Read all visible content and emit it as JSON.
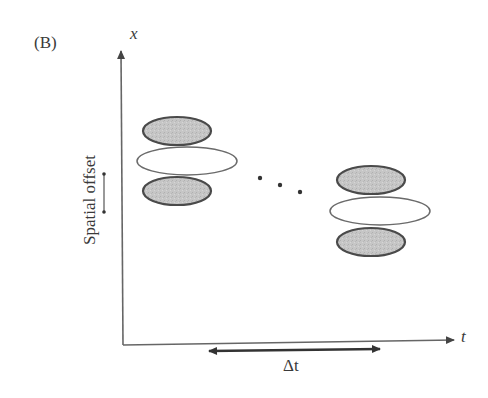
{
  "figure": {
    "panel_label": "(B)",
    "y_axis_label": "x",
    "x_axis_label": "t",
    "offset_label": "Spatial offset",
    "interval_label": "Δt",
    "continuation": "ellipsis-dots"
  },
  "colors": {
    "axis": "#555555",
    "ellipse_fill_grey": "#c4c4c4",
    "ellipse_stroke": "#4a4a4a",
    "ellipse_fill_white": "#ffffff",
    "text": "#3a3a3a"
  },
  "groups": [
    {
      "name": "early",
      "ellipses": [
        {
          "role": "flank-top",
          "cx": 177,
          "cy": 131,
          "rx": 34,
          "ry": 14,
          "fill": "grey"
        },
        {
          "role": "center",
          "cx": 187,
          "cy": 161,
          "rx": 50,
          "ry": 14,
          "fill": "white"
        },
        {
          "role": "flank-bottom",
          "cx": 177,
          "cy": 191,
          "rx": 34,
          "ry": 14,
          "fill": "grey"
        }
      ]
    },
    {
      "name": "late",
      "ellipses": [
        {
          "role": "flank-top",
          "cx": 371,
          "cy": 180,
          "rx": 34,
          "ry": 14,
          "fill": "grey"
        },
        {
          "role": "center",
          "cx": 380,
          "cy": 211,
          "rx": 50,
          "ry": 14,
          "fill": "white"
        },
        {
          "role": "flank-bottom",
          "cx": 371,
          "cy": 242,
          "rx": 34,
          "ry": 14,
          "fill": "grey"
        }
      ]
    }
  ]
}
